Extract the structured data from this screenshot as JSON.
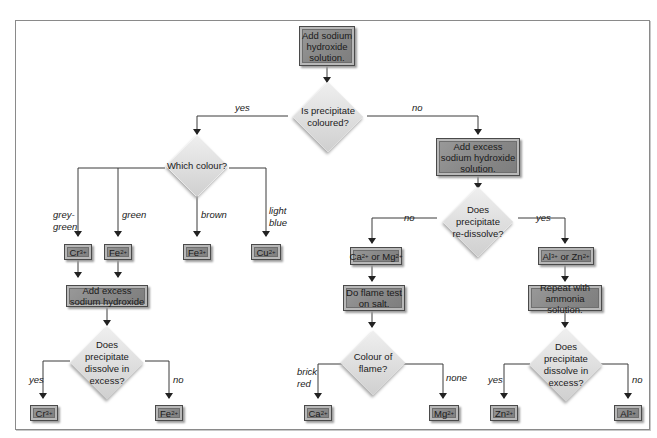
{
  "diagram": {
    "type": "flowchart",
    "start": {
      "text": "Add sodium\nhydroxide\nsolution."
    },
    "decision_coloured": {
      "text": "Is precipitate\ncoloured?",
      "yes_label": "yes",
      "no_label": "no"
    },
    "decision_which_colour": {
      "text": "Which colour?"
    },
    "colour_branches": [
      {
        "label": "grey-\ngreen",
        "ion": "Cr",
        "charge": "3+"
      },
      {
        "label": "green",
        "ion": "Fe",
        "charge": "2+"
      },
      {
        "label": "brown",
        "ion": "Fe",
        "charge": "3+"
      },
      {
        "label": "light\nblue",
        "ion": "Cu",
        "charge": "2+"
      }
    ],
    "left_excess": {
      "text": "Add excess\nsodium hydroxide"
    },
    "left_dissolve": {
      "text": "Does\nprecipitate\ndissolve in\nexcess?",
      "yes_label": "yes",
      "no_label": "no",
      "yes_ion": "Cr",
      "yes_charge": "3+",
      "no_ion": "Fe",
      "no_charge": "2+"
    },
    "right_excess": {
      "text": "Add excess\nsodium hydroxide\nsolution."
    },
    "redissolve": {
      "text": "Does\nprecipitate\nre-dissolve?",
      "no_label": "no",
      "yes_label": "yes"
    },
    "ca_mg": {
      "ion1": "Ca",
      "charge1": "2+",
      "or": " or ",
      "ion2": "Mg",
      "charge2": "2+"
    },
    "flame_test": {
      "text": "Do flame test\non salt."
    },
    "flame_colour": {
      "text": "Colour of\nflame?",
      "left_label": "brick\nred",
      "right_label": "none",
      "left_ion": "Ca",
      "left_charge": "2+",
      "right_ion": "Mg",
      "right_charge": "2+"
    },
    "al_zn": {
      "ion1": "Al",
      "charge1": "3+",
      "or": " or ",
      "ion2": "Zn",
      "charge2": "2+"
    },
    "ammonia": {
      "text": "Repeat with\nammonia solution."
    },
    "ammonia_dissolve": {
      "text": "Does\nprecipitate\ndissolve in\nexcess?",
      "yes_label": "yes",
      "no_label": "no",
      "yes_ion": "Zn",
      "yes_charge": "2+",
      "no_ion": "Al",
      "no_charge": "3+"
    }
  },
  "colors": {
    "box_fill": "#8a8a8a",
    "box_border": "#4a4a4a",
    "diamond_fill": "#e2e2e2",
    "line": "#333333",
    "frame": "#8a8a8a"
  }
}
